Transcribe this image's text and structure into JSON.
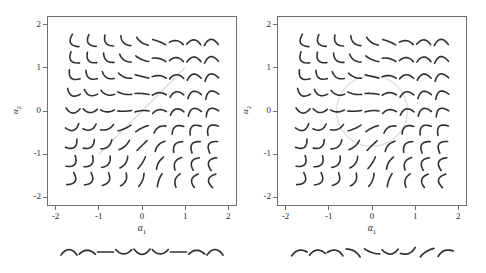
{
  "figure": {
    "width": 486,
    "height": 273,
    "background": "#ffffff",
    "panel_count": 2
  },
  "axes": {
    "x_label": "α1",
    "y_label": "α2",
    "x_ticks": [
      "-2",
      "-1",
      "0",
      "1",
      "2"
    ],
    "y_ticks": [
      "2",
      "1",
      "0",
      "-1",
      "-2"
    ],
    "x_tick_values": [
      -2,
      -1,
      0,
      1,
      2
    ],
    "y_tick_values": [
      2,
      1,
      0,
      -1,
      -2
    ],
    "xlim": [
      -2.2,
      2.2
    ],
    "ylim": [
      -2.2,
      2.2
    ],
    "frame_color": "#6f6f6f",
    "text_color": "#2b2b2b"
  },
  "chart_data": {
    "type": "scatter",
    "title": "",
    "xlabel": "α1",
    "ylabel": "α2",
    "xlim": [
      -2.2,
      2.2
    ],
    "ylim": [
      -2.2,
      2.2
    ],
    "grid": false,
    "legend": "none",
    "glyph_grid": {
      "description": "9x9 lattice of small curve glyphs placed at latent coordinates",
      "x": [
        -1.6,
        -1.2,
        -0.8,
        -0.4,
        0.0,
        0.4,
        0.8,
        1.2,
        1.6
      ],
      "y": [
        1.6,
        1.2,
        0.8,
        0.4,
        0.0,
        -0.4,
        -0.8,
        -1.2,
        -1.6
      ],
      "glyph_color": "#303030",
      "glyph_stroke_width": 1.6,
      "cell_half_width": 7,
      "cell_half_height": 6
    },
    "panels": [
      {
        "name": "left-panel",
        "index": 0,
        "overlay": {
          "kind": "line",
          "color": "#dcdcdc",
          "points": [
            [
              -1.0,
              -1.0
            ],
            [
              1.0,
              1.0
            ]
          ]
        },
        "strip": {
          "label": "",
          "count": 9,
          "curvature": [
            0.85,
            0.6,
            0.0,
            -0.65,
            -0.8,
            -0.65,
            0.0,
            0.6,
            0.85
          ],
          "tilt": [
            0,
            0,
            0,
            0,
            0,
            0,
            0,
            0,
            0
          ]
        },
        "curvature_rows": [
          [
            -0.95,
            -0.85,
            -0.7,
            -0.5,
            -0.25,
            0.1,
            0.45,
            0.75,
            0.95
          ],
          [
            -0.92,
            -0.8,
            -0.62,
            -0.4,
            -0.15,
            0.22,
            0.58,
            0.82,
            0.95
          ],
          [
            -0.88,
            -0.72,
            -0.52,
            -0.28,
            0.0,
            0.32,
            0.65,
            0.86,
            0.96
          ],
          [
            -0.82,
            -0.64,
            -0.42,
            -0.18,
            0.08,
            0.4,
            0.72,
            0.9,
            0.97
          ],
          [
            -0.78,
            -0.58,
            -0.34,
            -0.08,
            0.15,
            0.48,
            0.78,
            0.93,
            0.98
          ],
          [
            -0.8,
            -0.6,
            -0.38,
            -0.12,
            0.12,
            0.45,
            0.76,
            0.92,
            0.97
          ],
          [
            -0.85,
            -0.68,
            -0.48,
            -0.24,
            0.02,
            0.36,
            0.68,
            0.88,
            0.96
          ],
          [
            -0.9,
            -0.76,
            -0.58,
            -0.35,
            -0.1,
            0.26,
            0.6,
            0.84,
            0.95
          ],
          [
            -0.95,
            -0.84,
            -0.68,
            -0.46,
            -0.2,
            0.14,
            0.5,
            0.78,
            0.95
          ]
        ],
        "tilt_rows": [
          [
            62,
            58,
            52,
            44,
            34,
            22,
            10,
            2,
            -4
          ],
          [
            52,
            48,
            42,
            34,
            24,
            14,
            4,
            -2,
            -8
          ],
          [
            40,
            36,
            30,
            22,
            14,
            6,
            -2,
            -8,
            -14
          ],
          [
            24,
            20,
            16,
            10,
            4,
            -2,
            -10,
            -16,
            -22
          ],
          [
            4,
            2,
            0,
            -2,
            -4,
            -8,
            -14,
            -20,
            -26
          ],
          [
            -18,
            -20,
            -22,
            -24,
            -26,
            -30,
            -34,
            -38,
            -42
          ],
          [
            -36,
            -38,
            -40,
            -42,
            -44,
            -46,
            -50,
            -54,
            -56
          ],
          [
            -50,
            -52,
            -54,
            -56,
            -58,
            -60,
            -62,
            -64,
            -66
          ],
          [
            -60,
            -62,
            -64,
            -66,
            -68,
            -70,
            -72,
            -74,
            -76
          ]
        ]
      },
      {
        "name": "right-panel",
        "index": 1,
        "overlay": {
          "kind": "circle",
          "color": "#dcdcdc",
          "center": [
            0.0,
            0.0
          ],
          "radius": 0.82
        },
        "strip": {
          "label": "",
          "count": 9,
          "curvature": [
            0.55,
            0.65,
            0.6,
            0.35,
            -0.2,
            -0.7,
            -0.5,
            0.2,
            0.5
          ],
          "tilt": [
            -14,
            -6,
            12,
            30,
            18,
            -2,
            -22,
            -32,
            -20
          ]
        },
        "curvature_rows": [
          [
            -0.95,
            -0.85,
            -0.7,
            -0.5,
            -0.25,
            0.1,
            0.45,
            0.75,
            0.95
          ],
          [
            -0.92,
            -0.8,
            -0.62,
            -0.4,
            -0.15,
            0.22,
            0.58,
            0.82,
            0.95
          ],
          [
            -0.88,
            -0.72,
            -0.52,
            -0.28,
            0.0,
            0.32,
            0.65,
            0.86,
            0.96
          ],
          [
            -0.82,
            -0.64,
            -0.42,
            -0.18,
            0.08,
            0.4,
            0.72,
            0.9,
            0.97
          ],
          [
            -0.78,
            -0.58,
            -0.34,
            -0.08,
            0.15,
            0.48,
            0.78,
            0.93,
            0.98
          ],
          [
            -0.8,
            -0.6,
            -0.38,
            -0.12,
            0.12,
            0.45,
            0.76,
            0.92,
            0.97
          ],
          [
            -0.85,
            -0.68,
            -0.48,
            -0.24,
            0.02,
            0.36,
            0.68,
            0.88,
            0.96
          ],
          [
            -0.9,
            -0.76,
            -0.58,
            -0.35,
            -0.1,
            0.26,
            0.6,
            0.84,
            0.95
          ],
          [
            -0.95,
            -0.84,
            -0.68,
            -0.46,
            -0.2,
            0.14,
            0.5,
            0.78,
            0.95
          ]
        ],
        "tilt_rows": [
          [
            62,
            58,
            52,
            44,
            34,
            22,
            10,
            2,
            -4
          ],
          [
            52,
            48,
            42,
            34,
            24,
            14,
            4,
            -2,
            -8
          ],
          [
            40,
            36,
            30,
            22,
            14,
            6,
            -2,
            -8,
            -14
          ],
          [
            24,
            20,
            16,
            10,
            4,
            -2,
            -10,
            -16,
            -22
          ],
          [
            4,
            2,
            0,
            -2,
            -4,
            -8,
            -14,
            -20,
            -26
          ],
          [
            -18,
            -20,
            -22,
            -24,
            -26,
            -30,
            -34,
            -38,
            -42
          ],
          [
            -36,
            -38,
            -40,
            -42,
            -44,
            -46,
            -50,
            -54,
            -56
          ],
          [
            -50,
            -52,
            -54,
            -56,
            -58,
            -60,
            -62,
            -64,
            -66
          ],
          [
            -60,
            -62,
            -64,
            -66,
            -68,
            -70,
            -72,
            -74,
            -76
          ]
        ]
      }
    ]
  }
}
